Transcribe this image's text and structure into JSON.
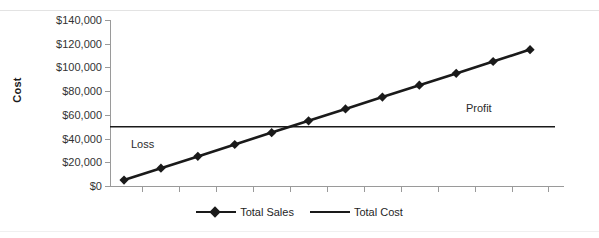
{
  "chart_data": {
    "type": "line",
    "title": "",
    "xlabel": "",
    "ylabel": "Cost",
    "ylim": [
      0,
      140000
    ],
    "y_ticks": [
      "$0",
      "$20,000",
      "$40,000",
      "$60,000",
      "$80,000",
      "$100,000",
      "$120,000",
      "$140,000"
    ],
    "y_tick_values": [
      0,
      20000,
      40000,
      60000,
      80000,
      100000,
      120000,
      140000
    ],
    "x_tick_count": 12,
    "x_tick_labels": [],
    "grid": false,
    "legend_position": "bottom",
    "x": [
      1,
      2,
      3,
      4,
      5,
      6,
      7,
      8,
      9,
      10,
      11,
      12
    ],
    "series": [
      {
        "name": "Total Sales",
        "marker": "diamond",
        "color": "#1a1a1a",
        "values": [
          5000,
          15000,
          25000,
          35000,
          45000,
          55000,
          65000,
          75000,
          85000,
          95000,
          105000,
          115000
        ]
      },
      {
        "name": "Total Cost",
        "marker": "none",
        "color": "#1a1a1a",
        "values": [
          50000,
          50000,
          50000,
          50000,
          50000,
          50000,
          50000,
          50000,
          50000,
          50000,
          50000,
          50000
        ]
      }
    ],
    "annotations": [
      {
        "text": "Loss",
        "x": 1.6,
        "y": 38000
      },
      {
        "text": "Profit",
        "x": 10.0,
        "y": 62000
      }
    ]
  },
  "axis": {
    "y_title": "Cost",
    "y_labels": [
      "$140,000",
      "$120,000",
      "$100,000",
      "$80,000",
      "$60,000",
      "$40,000",
      "$20,000",
      "$0"
    ]
  },
  "annotations": {
    "loss": "Loss",
    "profit": "Profit"
  },
  "legend": {
    "items": [
      {
        "label": "Total Sales"
      },
      {
        "label": "Total Cost"
      }
    ]
  }
}
